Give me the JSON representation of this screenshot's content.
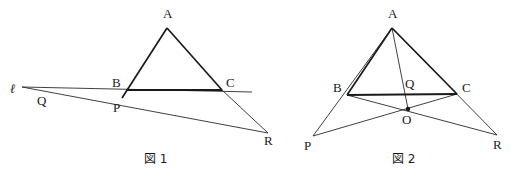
{
  "page": {
    "background_color": "#ffffff",
    "ink_color": "#1a1a1a",
    "width": 526,
    "height": 176
  },
  "figures": [
    {
      "id": "figure-1",
      "caption": "図 1",
      "caption_pos": {
        "x": 144,
        "y": 162
      },
      "description": "Triangle ABC with line l through B and a transversal through P meeting extended AC at R",
      "points": [
        {
          "name": "A",
          "label": "A",
          "x": 167,
          "y": 28,
          "label_x": 163,
          "label_y": 18,
          "dot": false
        },
        {
          "name": "B",
          "label": "B",
          "x": 125,
          "y": 90,
          "label_x": 112,
          "label_y": 87,
          "dot": false
        },
        {
          "name": "C",
          "label": "C",
          "x": 222,
          "y": 90,
          "label_x": 226,
          "label_y": 87,
          "dot": false
        },
        {
          "name": "P",
          "label": "P",
          "x": 122,
          "y": 98,
          "label_x": 113,
          "label_y": 112,
          "dot": false
        },
        {
          "name": "Q",
          "label": "Q",
          "x": 48,
          "y": 92,
          "label_x": 37,
          "label_y": 105,
          "dot": false
        },
        {
          "name": "R",
          "label": "R",
          "x": 268,
          "y": 133,
          "label_x": 267,
          "label_y": 145,
          "dot": false
        }
      ],
      "line_label": {
        "text": "ℓ",
        "x": 10,
        "y": 93
      },
      "segments": [
        {
          "name": "side-AB",
          "from": "A",
          "to": "B",
          "weight": "heavy"
        },
        {
          "name": "side-AC-extended",
          "from": "A",
          "to": "R",
          "weight": "heavy-to-C"
        },
        {
          "name": "side-BC",
          "from": "B",
          "to": "C",
          "weight": "heavy"
        },
        {
          "name": "line-l",
          "from": "l-left",
          "to": "C-right",
          "weight": "light"
        },
        {
          "name": "transversal-PR",
          "from": "Q-left",
          "to": "R",
          "weight": "light"
        }
      ]
    },
    {
      "id": "figure-2",
      "caption": "図 2",
      "caption_pos": {
        "x": 393,
        "y": 163
      },
      "description": "Triangle ABC with interior-adjacent point O, cevian AQ through O, and lines BOR and COP",
      "points": [
        {
          "name": "A",
          "label": "A",
          "x": 392,
          "y": 28,
          "label_x": 388,
          "label_y": 18,
          "dot": false
        },
        {
          "name": "B",
          "label": "B",
          "x": 347,
          "y": 95,
          "label_x": 334,
          "label_y": 92,
          "dot": false
        },
        {
          "name": "C",
          "label": "C",
          "x": 457,
          "y": 94,
          "label_x": 462,
          "label_y": 92,
          "dot": false
        },
        {
          "name": "O",
          "label": "O",
          "x": 408,
          "y": 109,
          "label_x": 403,
          "label_y": 123,
          "dot": true
        },
        {
          "name": "Q",
          "label": "Q",
          "x": 404,
          "y": 95,
          "label_x": 406,
          "label_y": 88,
          "dot": false
        },
        {
          "name": "P",
          "label": "P",
          "x": 313,
          "y": 136,
          "label_x": 306,
          "label_y": 150,
          "dot": false
        },
        {
          "name": "R",
          "label": "R",
          "x": 497,
          "y": 135,
          "label_x": 496,
          "label_y": 149,
          "dot": false
        }
      ],
      "segments": [
        {
          "name": "side-AB",
          "from": "A",
          "to": "B",
          "weight": "heavy"
        },
        {
          "name": "side-AC",
          "from": "A",
          "to": "C",
          "weight": "heavy"
        },
        {
          "name": "side-BC",
          "from": "B",
          "to": "C",
          "weight": "heavy"
        },
        {
          "name": "cevian-AO",
          "from": "A",
          "to": "O",
          "weight": "light"
        },
        {
          "name": "line-AP",
          "from": "A",
          "to": "P",
          "weight": "light"
        },
        {
          "name": "line-AR",
          "from": "A",
          "to": "R",
          "weight": "light"
        },
        {
          "name": "line-B-O-R",
          "from": "B",
          "to": "R",
          "weight": "light"
        },
        {
          "name": "line-C-O-P",
          "from": "C",
          "to": "P",
          "weight": "light"
        }
      ]
    }
  ]
}
